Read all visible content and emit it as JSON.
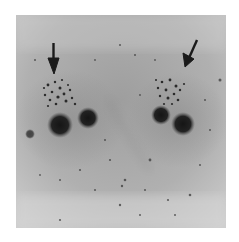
{
  "image": {
    "type": "grayscale micrograph",
    "description": "Two adjacent cells with dark nuclear bodies and granular clusters",
    "arrows": [
      {
        "label": "left-arrow",
        "direction": "down",
        "from": [
          53,
          43
        ],
        "to": [
          54,
          73
        ]
      },
      {
        "label": "right-arrow",
        "direction": "down-left",
        "from": [
          197,
          40
        ],
        "to": [
          185,
          66
        ]
      }
    ],
    "colors": {
      "background": "#ffffff",
      "field": "#b9b9b9",
      "dark": "#1e1e1e"
    }
  }
}
